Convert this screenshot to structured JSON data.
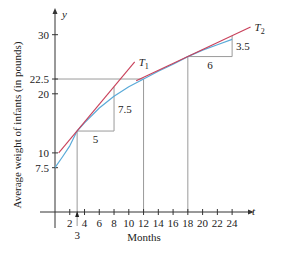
{
  "chart_data": {
    "type": "line",
    "title": "",
    "xlabel": "Months",
    "ylabel": "Average weight of infants (in pounds)",
    "x_axis_symbol": "t",
    "y_axis_symbol": "y",
    "xlim": [
      0,
      26
    ],
    "ylim": [
      0,
      32
    ],
    "x_ticks": [
      2,
      4,
      6,
      8,
      10,
      12,
      14,
      16,
      18,
      20,
      22,
      24
    ],
    "x_tick_labels": [
      "2",
      "4",
      "6",
      "8",
      "10",
      "12",
      "14",
      "16",
      "18",
      "20",
      "22",
      "24"
    ],
    "x_marker": {
      "value": 3,
      "label": "3"
    },
    "y_ticks": [
      7.5,
      10,
      20,
      22.5,
      30
    ],
    "y_tick_labels": [
      "7.5",
      "10",
      "20",
      "22.5",
      "30"
    ],
    "grid": false,
    "series": [
      {
        "name": "weight curve",
        "color": "#5aaad8",
        "x": [
          0,
          1,
          2,
          3,
          4,
          6,
          8,
          10,
          12,
          14,
          16,
          18,
          20,
          22,
          24
        ],
        "y": [
          7.5,
          9.3,
          11.2,
          13.7,
          15.1,
          17.6,
          19.6,
          21.2,
          22.5,
          23.8,
          25.0,
          26.3,
          27.4,
          28.3,
          29.2
        ]
      },
      {
        "name": "T1",
        "label": "T",
        "subscript": "1",
        "color": "#c8405a",
        "x": [
          0.5,
          10.8
        ],
        "y": [
          10.0,
          25.4
        ],
        "slope": 1.5,
        "tangent_at": 3
      },
      {
        "name": "T2",
        "label": "T",
        "subscript": "2",
        "color": "#c8405a",
        "x": [
          11,
          26.5
        ],
        "y": [
          22.2,
          31.3
        ],
        "slope": 0.583,
        "tangent_at": 18
      }
    ],
    "annotations": [
      {
        "type": "slope-triangle",
        "at": 3,
        "run": 5,
        "rise": 7.5,
        "run_label": "5",
        "rise_label": "7.5"
      },
      {
        "type": "slope-triangle",
        "at": 18,
        "run": 6,
        "rise": 3.5,
        "run_label": "6",
        "rise_label": "3.5"
      },
      {
        "type": "guide-line",
        "description": "horizontal from y=22.5 to curve at t=12; vertical from curve to axis at t=12"
      },
      {
        "type": "guide-line",
        "description": "vertical from curve to axis at t=18"
      }
    ]
  }
}
